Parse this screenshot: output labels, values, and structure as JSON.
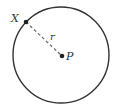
{
  "diagram": {
    "type": "circle-with-radius",
    "circle": {
      "cx": 61,
      "cy": 55,
      "r": 48,
      "stroke": "#333333"
    },
    "center_point": {
      "label": "P",
      "x": 62,
      "y": 56
    },
    "boundary_point": {
      "label": "X",
      "x": 26,
      "y": 22
    },
    "radius_segment": {
      "label": "r",
      "style": "dashed"
    }
  }
}
